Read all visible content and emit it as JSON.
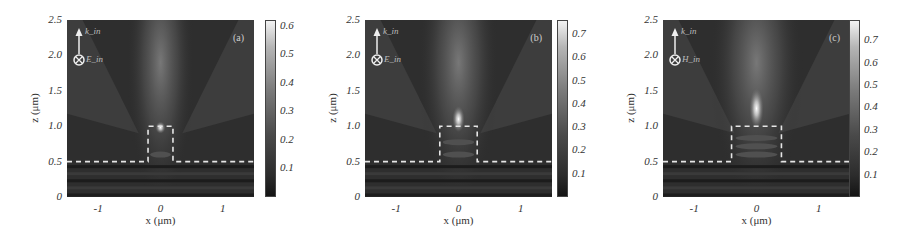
{
  "figure": {
    "panels": [
      {
        "id": "a",
        "tag": "(a)",
        "wave_label": "k_in",
        "field_label": "E_in",
        "colorbar_ticks": [
          "0.6",
          "0.5",
          "0.4",
          "0.3",
          "0.2",
          "0.1"
        ],
        "colorbar_max": 0.62
      },
      {
        "id": "b",
        "tag": "(b)",
        "wave_label": "k_in",
        "field_label": "E_in",
        "colorbar_ticks": [
          "0.7",
          "0.6",
          "0.5",
          "0.4",
          "0.3",
          "0.2",
          "0.1"
        ],
        "colorbar_max": 0.76
      },
      {
        "id": "c",
        "tag": "(c)",
        "wave_label": "k_in",
        "field_label": "H_in",
        "colorbar_ticks": [
          "0.7",
          "0.6",
          "0.5",
          "0.4",
          "0.3",
          "0.2",
          "0.1"
        ],
        "colorbar_max": 0.79
      }
    ],
    "xlabel": "x (μm)",
    "ylabel": "z (μm)",
    "xticks": [
      "-1",
      "0",
      "1"
    ],
    "yticks": [
      "2.5",
      "2.0",
      "1.5",
      "1.0",
      "0.5",
      "0"
    ]
  },
  "chart_data": [
    {
      "type": "heatmap",
      "title": "(a)",
      "xlabel": "x (μm)",
      "ylabel": "z (μm)",
      "xlim": [
        -1.5,
        1.5
      ],
      "ylim": [
        0,
        2.5
      ],
      "xticks": [
        -1,
        0,
        1
      ],
      "yticks": [
        0,
        0.5,
        1.0,
        1.5,
        2.0,
        2.5
      ],
      "colorbar": {
        "min": 0,
        "max": 0.62,
        "ticks": [
          0.1,
          0.2,
          0.3,
          0.4,
          0.5,
          0.6
        ]
      },
      "annotations": {
        "substrate_interface_z": 0.5,
        "block": {
          "x_min": -0.2,
          "x_max": 0.2,
          "z_min": 0.5,
          "z_max": 1.0,
          "style": "white dashed"
        },
        "incident_wavevector": "k_in (up)",
        "incident_field": "E_in (into page)"
      },
      "features": {
        "hotspot": {
          "x": 0.0,
          "z": 0.98,
          "intensity": 0.6
        },
        "beam": "weak V-shaped jet spreading upward"
      }
    },
    {
      "type": "heatmap",
      "title": "(b)",
      "xlabel": "x (μm)",
      "ylabel": "z (μm)",
      "xlim": [
        -1.5,
        1.5
      ],
      "ylim": [
        0,
        2.5
      ],
      "xticks": [
        -1,
        0,
        1
      ],
      "yticks": [
        0,
        0.5,
        1.0,
        1.5,
        2.0,
        2.5
      ],
      "colorbar": {
        "min": 0,
        "max": 0.76,
        "ticks": [
          0.1,
          0.2,
          0.3,
          0.4,
          0.5,
          0.6,
          0.7
        ]
      },
      "annotations": {
        "substrate_interface_z": 0.5,
        "block": {
          "x_min": -0.3,
          "x_max": 0.3,
          "z_min": 0.5,
          "z_max": 1.0,
          "style": "white dashed"
        },
        "incident_wavevector": "k_in (up)",
        "incident_field": "E_in (into page)"
      },
      "features": {
        "hotspot": {
          "x": 0.0,
          "z": 1.1,
          "intensity": 0.75
        },
        "beam": "photonic jet above block"
      }
    },
    {
      "type": "heatmap",
      "title": "(c)",
      "xlabel": "x (μm)",
      "ylabel": "z (μm)",
      "xlim": [
        -1.5,
        1.5
      ],
      "ylim": [
        0,
        2.5
      ],
      "xticks": [
        -1,
        0,
        1
      ],
      "yticks": [
        0,
        0.5,
        1.0,
        1.5,
        2.0,
        2.5
      ],
      "colorbar": {
        "min": 0,
        "max": 0.79,
        "ticks": [
          0.1,
          0.2,
          0.3,
          0.4,
          0.5,
          0.6,
          0.7
        ]
      },
      "annotations": {
        "substrate_interface_z": 0.5,
        "block": {
          "x_min": -0.4,
          "x_max": 0.4,
          "z_min": 0.5,
          "z_max": 1.0,
          "style": "white dashed"
        },
        "incident_wavevector": "k_in (up)",
        "incident_field": "H_in (into page)"
      },
      "features": {
        "hotspot": {
          "x": 0.0,
          "z": 1.25,
          "intensity": 0.78
        },
        "beam": "elongated photonic jet, standing-wave fringes inside block"
      }
    }
  ]
}
